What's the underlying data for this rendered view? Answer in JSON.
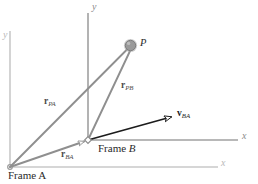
{
  "figure": {
    "type": "vector-diagram"
  },
  "frame_a": {
    "name": "Frame A",
    "origin_marker": "origin-dot",
    "y_axis_label": "y",
    "x_axis_label": "x",
    "color": "#c4c4c4"
  },
  "frame_b": {
    "name_prefix": "Frame ",
    "name_italic": "B",
    "origin_marker": "open-diamond",
    "y_axis_label": "y",
    "x_axis_label": "x",
    "color": "#9a9a9a"
  },
  "point": {
    "label": "P",
    "marker": "filled-circle",
    "color": "#9e9e9e"
  },
  "vectors": [
    {
      "id": "r-pa",
      "symbol": "r",
      "subscript": "PA",
      "from": "Frame A origin",
      "to": "P",
      "color": "#8f8f8f",
      "arrowhead": "none"
    },
    {
      "id": "r-pb",
      "symbol": "r",
      "subscript": "PB",
      "from": "Frame B origin",
      "to": "P",
      "color": "#8f8f8f",
      "arrowhead": "none"
    },
    {
      "id": "r-ba",
      "symbol": "r",
      "subscript": "BA",
      "from": "Frame A origin",
      "to": "Frame B origin",
      "color": "#8f8f8f",
      "arrowhead": "open"
    },
    {
      "id": "v-ba",
      "symbol": "v",
      "subscript": "BA",
      "from": "Frame B origin",
      "to": "velocity direction",
      "color": "#1c1c1c",
      "arrowhead": "open"
    }
  ]
}
